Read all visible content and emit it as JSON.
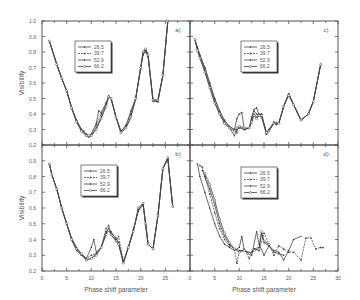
{
  "chart_data": {
    "type": "line",
    "layout": "2x2 grid of panels sharing axes",
    "xlabel": "Phase shift parameter",
    "ylabel": "Visibility",
    "xlim": [
      0,
      30
    ],
    "ylim": [
      0.2,
      1.0
    ],
    "x_ticks": [
      0,
      5,
      10,
      15,
      20,
      25,
      30
    ],
    "y_ticks": [
      0.2,
      0.3,
      0.4,
      0.5,
      0.6,
      0.7,
      0.8,
      0.9,
      1.0
    ],
    "y_tick_labels": [
      "0.2",
      "0.3",
      "0.4",
      "0.5",
      "0.6",
      "0.7",
      "0.8",
      "0.9",
      "1.0"
    ],
    "grid": false,
    "legend_position": "upper-left-center inside each panel",
    "legend_entries": [
      "26.5",
      "39.7",
      "52.9",
      "66.2"
    ],
    "panels": [
      {
        "label": "a)",
        "position": "top-left",
        "series": [
          {
            "name": "26.5",
            "x": [
              1.5,
              3,
              4,
              5,
              6,
              7,
              8,
              8.5,
              9,
              9.5,
              10,
              11,
              11.5,
              12,
              13,
              13.5,
              14,
              15,
              16,
              17,
              18,
              19,
              20,
              20.5,
              21,
              21.5,
              22.5,
              23.5,
              24.5,
              25.5
            ],
            "y": [
              0.87,
              0.72,
              0.63,
              0.55,
              0.44,
              0.36,
              0.3,
              0.29,
              0.27,
              0.26,
              0.27,
              0.34,
              0.42,
              0.41,
              0.47,
              0.51,
              0.5,
              0.38,
              0.29,
              0.32,
              0.42,
              0.5,
              0.69,
              0.8,
              0.82,
              0.78,
              0.49,
              0.49,
              0.65,
              1.0
            ]
          },
          {
            "name": "39.7",
            "x": [
              1.5,
              3,
              4,
              5,
              6,
              7,
              8,
              9,
              9.5,
              10,
              11,
              12,
              13,
              13.5,
              14,
              15,
              16,
              17,
              18,
              19,
              20,
              20.5,
              21,
              21.5,
              22.5,
              23.5,
              24.5,
              25.5
            ],
            "y": [
              0.87,
              0.72,
              0.63,
              0.55,
              0.44,
              0.36,
              0.3,
              0.27,
              0.26,
              0.27,
              0.33,
              0.4,
              0.47,
              0.51,
              0.5,
              0.38,
              0.29,
              0.33,
              0.4,
              0.5,
              0.7,
              0.79,
              0.8,
              0.77,
              0.49,
              0.48,
              0.65,
              1.0
            ]
          },
          {
            "name": "52.9",
            "x": [
              1.5,
              3,
              4,
              5,
              6,
              7,
              8,
              9,
              9.5,
              10,
              11,
              12,
              13,
              13.5,
              14,
              15,
              16,
              17,
              18,
              19,
              20,
              20.5,
              21,
              21.5,
              22.5,
              23.5,
              24.5,
              25.5
            ],
            "y": [
              0.87,
              0.72,
              0.63,
              0.55,
              0.44,
              0.35,
              0.29,
              0.26,
              0.25,
              0.26,
              0.31,
              0.38,
              0.46,
              0.52,
              0.5,
              0.38,
              0.28,
              0.31,
              0.38,
              0.5,
              0.7,
              0.78,
              0.81,
              0.77,
              0.48,
              0.48,
              0.65,
              1.0
            ]
          },
          {
            "name": "66.2",
            "x": [
              1.5,
              3,
              4,
              5,
              6,
              7,
              8,
              9,
              9.5,
              10,
              11,
              12,
              13,
              13.5,
              14,
              15,
              16,
              17,
              18,
              19,
              20,
              20.5,
              21,
              21.5,
              22.5,
              23.5,
              24.5,
              25.5
            ],
            "y": [
              0.87,
              0.72,
              0.63,
              0.55,
              0.44,
              0.35,
              0.29,
              0.26,
              0.26,
              0.26,
              0.3,
              0.37,
              0.45,
              0.51,
              0.5,
              0.38,
              0.28,
              0.31,
              0.38,
              0.5,
              0.7,
              0.8,
              0.82,
              0.78,
              0.49,
              0.49,
              0.65,
              1.0
            ]
          }
        ]
      },
      {
        "label": "b)",
        "position": "bottom-left",
        "series": [
          {
            "name": "26.5",
            "x": [
              1.5,
              2,
              3,
              4,
              5,
              6,
              7,
              8,
              9,
              10,
              10.5,
              11,
              12,
              13,
              13.5,
              14,
              15,
              15.5,
              16.5,
              17.5,
              18.5,
              19.5,
              20.5,
              21,
              21.5,
              22.5,
              23.5,
              24.5,
              25.5,
              26.5
            ],
            "y": [
              0.88,
              0.81,
              0.72,
              0.6,
              0.5,
              0.41,
              0.35,
              0.31,
              0.28,
              0.35,
              0.4,
              0.32,
              0.35,
              0.45,
              0.47,
              0.44,
              0.41,
              0.38,
              0.25,
              0.35,
              0.46,
              0.58,
              0.63,
              0.5,
              0.37,
              0.34,
              0.55,
              0.85,
              0.92,
              0.61
            ]
          },
          {
            "name": "39.7",
            "x": [
              1.5,
              2,
              3,
              4,
              5,
              6,
              7,
              8,
              9,
              10,
              11,
              12,
              13,
              13.5,
              14,
              15,
              15.5,
              16.5,
              17.5,
              18.5,
              19.5,
              20.5,
              21,
              21.5,
              22.5,
              23.5,
              24.5,
              25.5,
              26.5
            ],
            "y": [
              0.88,
              0.81,
              0.72,
              0.6,
              0.5,
              0.4,
              0.34,
              0.3,
              0.28,
              0.3,
              0.31,
              0.35,
              0.47,
              0.49,
              0.43,
              0.39,
              0.42,
              0.26,
              0.35,
              0.46,
              0.58,
              0.62,
              0.5,
              0.37,
              0.34,
              0.55,
              0.85,
              0.91,
              0.61
            ]
          },
          {
            "name": "52.9",
            "x": [
              1.5,
              2,
              3,
              4,
              5,
              6,
              7,
              8,
              9,
              10,
              11,
              12,
              13,
              13.5,
              14,
              15,
              15.5,
              16.5,
              17.5,
              18.5,
              19.5,
              20.5,
              21,
              21.5,
              22.5,
              23.5,
              24.5,
              25.5,
              26.5
            ],
            "y": [
              0.88,
              0.81,
              0.72,
              0.6,
              0.5,
              0.4,
              0.33,
              0.3,
              0.27,
              0.28,
              0.31,
              0.35,
              0.44,
              0.47,
              0.45,
              0.4,
              0.38,
              0.26,
              0.35,
              0.45,
              0.59,
              0.62,
              0.5,
              0.37,
              0.34,
              0.55,
              0.85,
              0.91,
              0.61
            ]
          },
          {
            "name": "66.2",
            "x": [
              1.5,
              2,
              3,
              4,
              5,
              6,
              7,
              8,
              9,
              10,
              11,
              12,
              13,
              13.5,
              14,
              15,
              15.5,
              16.5,
              17.5,
              18.5,
              19.5,
              20.5,
              21,
              21.5,
              22.5,
              23.5,
              24.5,
              25.5,
              26.5
            ],
            "y": [
              0.88,
              0.81,
              0.72,
              0.6,
              0.5,
              0.4,
              0.34,
              0.31,
              0.27,
              0.28,
              0.3,
              0.35,
              0.43,
              0.46,
              0.43,
              0.39,
              0.37,
              0.25,
              0.35,
              0.45,
              0.6,
              0.63,
              0.5,
              0.37,
              0.34,
              0.55,
              0.85,
              0.92,
              0.61
            ]
          }
        ]
      },
      {
        "label": "c)",
        "position": "top-right",
        "series": [
          {
            "name": "26.5",
            "x": [
              1,
              1.5,
              2,
              3,
              4,
              5,
              6,
              7,
              8,
              9,
              9.5,
              10,
              10.5,
              11,
              12,
              12.5,
              13,
              13.5,
              14,
              14.5,
              15.5,
              16,
              17,
              17.5,
              18,
              19,
              20,
              21,
              22.5,
              24,
              25,
              26.5
            ],
            "y": [
              0.88,
              0.83,
              0.78,
              0.7,
              0.6,
              0.5,
              0.42,
              0.36,
              0.32,
              0.3,
              0.37,
              0.4,
              0.41,
              0.3,
              0.31,
              0.38,
              0.43,
              0.44,
              0.39,
              0.38,
              0.27,
              0.29,
              0.34,
              0.33,
              0.34,
              0.45,
              0.53,
              0.46,
              0.36,
              0.4,
              0.48,
              0.72
            ]
          },
          {
            "name": "39.7",
            "x": [
              1,
              1.5,
              2,
              3,
              4,
              5,
              6,
              7,
              8,
              9,
              9.5,
              10,
              11,
              12,
              12.5,
              13,
              13.5,
              14,
              14.5,
              15.5,
              16,
              17,
              18,
              19,
              20,
              21,
              22.5,
              24,
              25,
              26.5
            ],
            "y": [
              0.88,
              0.83,
              0.78,
              0.7,
              0.6,
              0.5,
              0.42,
              0.35,
              0.32,
              0.3,
              0.28,
              0.32,
              0.3,
              0.31,
              0.37,
              0.42,
              0.4,
              0.39,
              0.4,
              0.28,
              0.3,
              0.35,
              0.34,
              0.45,
              0.53,
              0.46,
              0.36,
              0.4,
              0.48,
              0.72
            ]
          },
          {
            "name": "52.9",
            "x": [
              1,
              1.5,
              2,
              3,
              4,
              5,
              6,
              7,
              8,
              9,
              9.5,
              10,
              11,
              12,
              12.5,
              13,
              13.5,
              14,
              14.5,
              15.5,
              16,
              17,
              18,
              19,
              20,
              21,
              22.5,
              24,
              25,
              26.5
            ],
            "y": [
              0.88,
              0.82,
              0.77,
              0.68,
              0.58,
              0.48,
              0.4,
              0.34,
              0.31,
              0.26,
              0.3,
              0.31,
              0.3,
              0.31,
              0.36,
              0.4,
              0.38,
              0.4,
              0.4,
              0.27,
              0.3,
              0.34,
              0.34,
              0.45,
              0.53,
              0.46,
              0.36,
              0.4,
              0.48,
              0.72
            ]
          },
          {
            "name": "66.2",
            "x": [
              1,
              1.5,
              2,
              3,
              4,
              5,
              6,
              7,
              8,
              9,
              9.5,
              10,
              11,
              12,
              12.5,
              13,
              13.5,
              14,
              14.5,
              15.5,
              16,
              17,
              18,
              19,
              20,
              21,
              22.5,
              24,
              25,
              26.5
            ],
            "y": [
              0.88,
              0.81,
              0.76,
              0.67,
              0.57,
              0.47,
              0.4,
              0.34,
              0.31,
              0.29,
              0.31,
              0.32,
              0.31,
              0.31,
              0.35,
              0.39,
              0.37,
              0.39,
              0.39,
              0.28,
              0.29,
              0.34,
              0.34,
              0.45,
              0.52,
              0.46,
              0.36,
              0.4,
              0.48,
              0.72
            ]
          }
        ]
      },
      {
        "label": "d)",
        "position": "bottom-right",
        "series": [
          {
            "name": "26.5",
            "x": [
              1.5,
              2,
              3,
              4,
              5,
              6,
              7,
              8,
              9,
              10,
              10.5,
              11,
              12,
              12.5,
              13.5,
              14,
              15,
              16,
              17,
              18,
              19,
              20,
              21,
              22.5
            ],
            "y": [
              0.88,
              0.8,
              0.7,
              0.6,
              0.5,
              0.42,
              0.37,
              0.35,
              0.33,
              0.35,
              0.42,
              0.33,
              0.32,
              0.3,
              0.45,
              0.37,
              0.3,
              0.36,
              0.33,
              0.32,
              0.27,
              0.33,
              0.4,
              0.42
            ]
          },
          {
            "name": "39.7",
            "x": [
              2,
              2.5,
              3,
              4,
              5,
              6,
              7,
              8,
              9,
              9.5,
              10,
              11,
              12,
              13,
              14,
              15,
              16,
              17,
              18,
              19,
              20,
              21,
              22.5,
              23.5,
              24.5,
              25.5,
              26.5,
              27
            ],
            "y": [
              0.87,
              0.86,
              0.8,
              0.69,
              0.57,
              0.47,
              0.4,
              0.36,
              0.34,
              0.25,
              0.32,
              0.34,
              0.28,
              0.34,
              0.33,
              0.44,
              0.37,
              0.3,
              0.36,
              0.34,
              0.32,
              0.32,
              0.27,
              0.41,
              0.41,
              0.34,
              0.35,
              0.35
            ]
          },
          {
            "name": "52.9",
            "x": [
              2.5,
              3,
              4,
              5,
              6,
              7,
              8,
              9,
              10,
              11,
              12,
              13,
              14,
              14.5,
              15,
              16,
              17,
              18,
              19
            ],
            "y": [
              0.84,
              0.8,
              0.72,
              0.62,
              0.5,
              0.42,
              0.37,
              0.34,
              0.33,
              0.33,
              0.31,
              0.34,
              0.35,
              0.44,
              0.38,
              0.36,
              0.32,
              0.31,
              0.3
            ]
          },
          {
            "name": "66.2",
            "x": [
              3,
              3.5,
              4,
              5,
              6,
              7,
              8,
              9,
              10,
              11,
              12,
              13,
              14,
              14.5,
              15,
              16
            ],
            "y": [
              0.82,
              0.78,
              0.75,
              0.65,
              0.53,
              0.44,
              0.38,
              0.34,
              0.32,
              0.33,
              0.31,
              0.33,
              0.34,
              0.45,
              0.39,
              0.37
            ]
          }
        ]
      }
    ]
  }
}
